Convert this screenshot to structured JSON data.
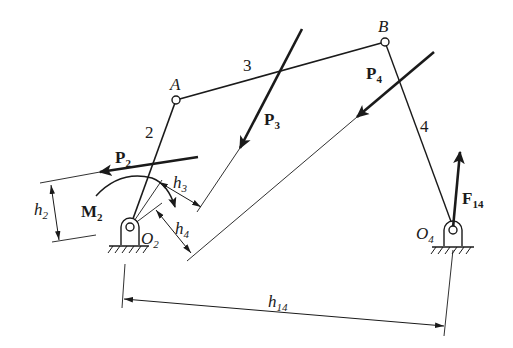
{
  "diagram": {
    "colors": {
      "ink": "#1a1a1a",
      "background": "#ffffff"
    },
    "joints": {
      "A": {
        "label": "A"
      },
      "B": {
        "label": "B"
      },
      "O2": {
        "label": "O",
        "sub": "2"
      },
      "O4": {
        "label": "O",
        "sub": "4"
      }
    },
    "links": [
      {
        "id": "2",
        "label": "2",
        "from": "O2",
        "to": "A"
      },
      {
        "id": "3",
        "label": "3",
        "from": "A",
        "to": "B"
      },
      {
        "id": "4",
        "label": "4",
        "from": "B",
        "to": "O4"
      }
    ],
    "forces": {
      "P2": {
        "label": "P",
        "sub": "2"
      },
      "P3": {
        "label": "P",
        "sub": "3"
      },
      "P4": {
        "label": "P",
        "sub": "4"
      },
      "F14": {
        "label": "F",
        "sub": "14"
      }
    },
    "moment": {
      "label": "M",
      "sub": "2"
    },
    "dimensions": {
      "h2": {
        "label": "h",
        "sub": "2"
      },
      "h3": {
        "label": "h",
        "sub": "3"
      },
      "h4": {
        "label": "h",
        "sub": "4"
      },
      "h14": {
        "label": "h",
        "sub": "14"
      }
    }
  }
}
